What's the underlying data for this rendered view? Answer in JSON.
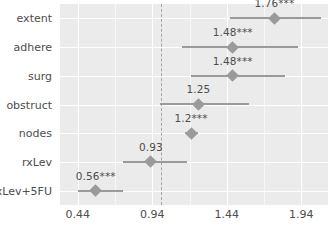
{
  "chart_data": {
    "type": "scatter",
    "subtype": "forest-plot",
    "title": "",
    "xlabel": "",
    "ylabel": "",
    "xticks": [
      0.44,
      0.94,
      1.44,
      1.94
    ],
    "xtick_labels": [
      "0.44",
      "0.94",
      "1.44",
      "1.94"
    ],
    "xlim": [
      0.32,
      2.12
    ],
    "reference_line": 1.0,
    "reference_line_style": "dashed",
    "grid": true,
    "legend": "none",
    "categories": [
      "extent",
      "adhere",
      "surg",
      "obstruct",
      "nodes",
      "rxLev",
      "rxLev+5FU"
    ],
    "points": [
      {
        "label": "extent",
        "estimate": 1.76,
        "display": "1.76***",
        "low": 1.46,
        "high": 2.07,
        "significance": "***"
      },
      {
        "label": "adhere",
        "estimate": 1.48,
        "display": "1.48***",
        "low": 1.14,
        "high": 1.92,
        "significance": "***"
      },
      {
        "label": "surg",
        "estimate": 1.48,
        "display": "1.48***",
        "low": 1.2,
        "high": 1.83,
        "significance": "***"
      },
      {
        "label": "obstruct",
        "estimate": 1.25,
        "display": "1.25",
        "low": 0.99,
        "high": 1.59,
        "significance": ""
      },
      {
        "label": "nodes",
        "estimate": 1.2,
        "display": "1.2***",
        "low": 1.16,
        "high": 1.25,
        "significance": "***"
      },
      {
        "label": "rxLev",
        "estimate": 0.93,
        "display": "0.93",
        "low": 0.74,
        "high": 1.17,
        "significance": ""
      },
      {
        "label": "rxLev+5FU",
        "estimate": 0.56,
        "display": "0.56***",
        "low": 0.44,
        "high": 0.74,
        "significance": "***"
      }
    ]
  },
  "style": {
    "panel_background": "#ebebeb",
    "gridline_major": "#ffffff",
    "gridline_minor": "#f7f7f7",
    "marker_color": "#9a9a9a",
    "text_color": "#4d4d4d",
    "reference_color": "#a5a5a5"
  }
}
